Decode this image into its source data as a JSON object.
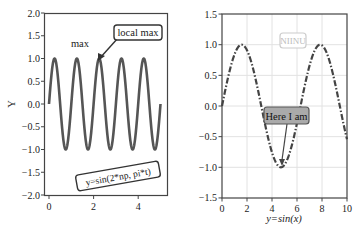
{
  "chart_data": [
    {
      "type": "line",
      "title": "",
      "xlabel": "",
      "ylabel": "Y",
      "xlim": [
        -0.2,
        5.3
      ],
      "ylim": [
        -2.0,
        2.0
      ],
      "xticks": [
        "0",
        "2",
        "4"
      ],
      "yticks": [
        "2.0",
        "1.5",
        "1.0",
        "0.5",
        "0.0",
        "-0.5",
        "-1.0",
        "-1.5",
        "-2.0"
      ],
      "grid": false,
      "series": [
        {
          "name": "sin(2*pi*t)",
          "function": "sin(2*pi*t)",
          "x_range": [
            0,
            5
          ],
          "style": "solid",
          "color": "#555555"
        }
      ],
      "annotations": [
        {
          "text": "max",
          "x": 1.25,
          "y": 1.5,
          "boxed": false
        },
        {
          "text": "local max",
          "x": 3.4,
          "y": 1.6,
          "boxed": true,
          "arrow_to": [
            2.25,
            1.0
          ]
        },
        {
          "text": "y=sin(2*np, pi*t)",
          "x": 3.1,
          "y": -1.6,
          "boxed": true,
          "rotation": -10
        }
      ]
    },
    {
      "type": "line",
      "title": "",
      "xlabel": "y=sin(x)",
      "ylabel": "",
      "xlim": [
        0,
        10
      ],
      "ylim": [
        -1.5,
        1.5
      ],
      "xticks": [
        "0",
        "2",
        "4",
        "6",
        "8",
        "10"
      ],
      "yticks": [
        "1.5",
        "1.0",
        "0.5",
        "0.0",
        "-0.5",
        "-1.0",
        "-1.5"
      ],
      "grid": true,
      "series": [
        {
          "name": "sin(x)",
          "function": "sin(x)",
          "x_range": [
            0,
            10
          ],
          "style": "dashdot",
          "color": "#444444"
        }
      ],
      "annotations": [
        {
          "text": "NIINU",
          "x": 4.8,
          "y": 1.0,
          "boxed": true,
          "faded": true
        },
        {
          "text": "Here I am",
          "x": 5.1,
          "y": -0.05,
          "boxed": true,
          "fill": "#aaaaaa",
          "arrow_to": [
            4.71,
            -1.0
          ]
        }
      ]
    }
  ]
}
